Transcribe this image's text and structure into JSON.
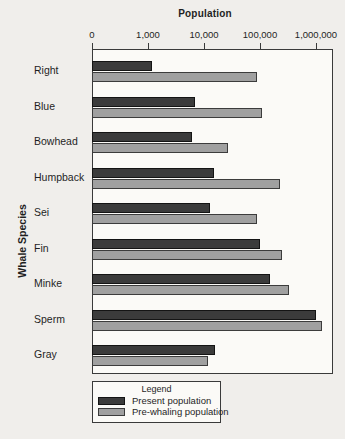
{
  "chart_data": {
    "type": "bar",
    "orientation": "horizontal",
    "xlabel": "Population",
    "ylabel": "Whale Species",
    "x_scale": "log",
    "x_ticks": [
      "0",
      "1,000",
      "10,000",
      "100,000",
      "1,000,000"
    ],
    "x_range_note": "log axis, one decade per division starting at 1,000; first division spans 0-1,000",
    "grid": false,
    "categories": [
      "Right",
      "Blue",
      "Bowhead",
      "Humpback",
      "Sei",
      "Fin",
      "Minke",
      "Sperm",
      "Gray"
    ],
    "series": [
      {
        "name": "Present population",
        "color": "#3b3b3b",
        "values": [
          1200,
          7000,
          6000,
          15000,
          13000,
          100000,
          150000,
          1000000,
          16000
        ]
      },
      {
        "name": "Pre-whaling population",
        "color": "#a0a0a0",
        "values": [
          90000,
          110000,
          27000,
          230000,
          90000,
          250000,
          330000,
          1300000,
          12000
        ]
      }
    ],
    "legend": {
      "title": "Legend",
      "position": "bottom-left"
    },
    "colors": {
      "background": "#f0eeeb",
      "plot_background": "#fbfaf7",
      "axis": "#3a3a3a",
      "text": "#1f1f1f"
    }
  }
}
